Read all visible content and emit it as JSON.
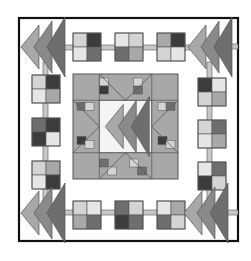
{
  "image": {
    "title": "Quilt block pattern",
    "description": "Grayscale quilt block with flying-geese corners, four-patch sashing border, and central star medallion"
  },
  "palette": {
    "background": "#ffffff",
    "frame": "#111111",
    "outline": "#555555",
    "white": "#f4f4f4",
    "light": "#d4d4d4",
    "pale": "#e6e6e6",
    "mid": "#a8a8a8",
    "medium_dark": "#8a8a8a",
    "dark": "#6e6e6e",
    "darkest": "#3c3c3c",
    "sash": "#c8c8c8"
  },
  "frame": {
    "x": 19,
    "y": 18,
    "w": 219,
    "h": 223
  },
  "four_patches": {
    "top": [
      [
        "light",
        "darkest",
        "pale",
        "dark"
      ],
      [
        "pale",
        "light",
        "dark",
        "mid"
      ],
      [
        "mid",
        "darkest",
        "light",
        "pale"
      ]
    ],
    "bottom": [
      [
        "light",
        "pale",
        "mid",
        "dark"
      ],
      [
        "dark",
        "light",
        "darkest",
        "dark"
      ],
      [
        "pale",
        "mid",
        "dark",
        "light"
      ]
    ],
    "left": [
      [
        "light",
        "darkest",
        "pale",
        "mid"
      ],
      [
        "dark",
        "darkest",
        "darkest",
        "pale"
      ],
      [
        "light",
        "mid",
        "pale",
        "darkest"
      ]
    ],
    "right": [
      [
        "darkest",
        "pale",
        "light",
        "mid"
      ],
      [
        "light",
        "dark",
        "pale",
        "mid"
      ],
      [
        "pale",
        "dark",
        "darkest",
        "light"
      ]
    ]
  },
  "center": {
    "x": 73,
    "y": 74,
    "size": 105,
    "caption": "Star medallion"
  }
}
